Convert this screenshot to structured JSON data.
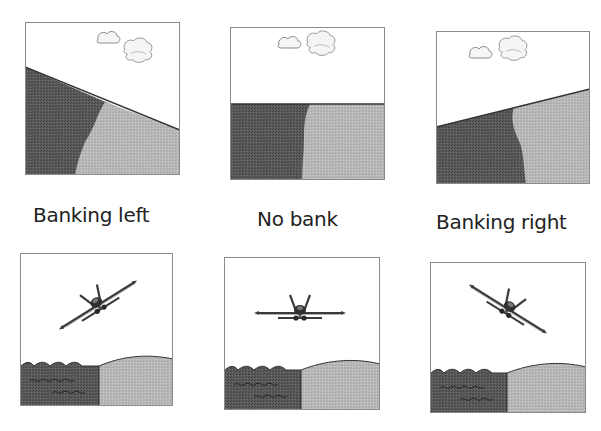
{
  "colors": {
    "sky": "#ffffff",
    "dark_ground": "#555555",
    "light_ground": "#b5b5b5",
    "border": "#8a8a8a",
    "cloud_fill": "#f4f4f4",
    "cloud_stroke": "#8c8c8c",
    "aircraft": "#3a3a3a"
  },
  "captions": {
    "left": "Banking left",
    "none": "No bank",
    "right": "Banking right"
  },
  "top_row": {
    "description": "Horizon views from cockpit",
    "panels": [
      {
        "id": "view-banking-left",
        "horizon": "tilted down to the right"
      },
      {
        "id": "view-no-bank",
        "horizon": "level"
      },
      {
        "id": "view-banking-right",
        "horizon": "tilted up to the right"
      }
    ]
  },
  "bottom_row": {
    "description": "Aircraft seen from behind over water and land",
    "panels": [
      {
        "id": "aircraft-banking-left",
        "wing_angle_deg": -32
      },
      {
        "id": "aircraft-no-bank",
        "wing_angle_deg": 0
      },
      {
        "id": "aircraft-banking-right",
        "wing_angle_deg": 32
      }
    ]
  }
}
